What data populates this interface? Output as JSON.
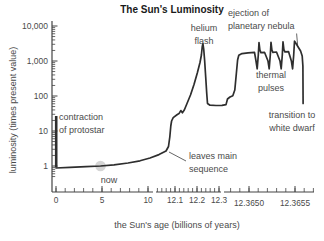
{
  "title": "The Sun's Luminosity",
  "chart_data": {
    "type": "line",
    "title": "The Sun's Luminosity",
    "xlabel": "the Sun's age (billions of years)",
    "ylabel": "luminosity (times present value)",
    "y_scale": "log",
    "y_tick_labels": [
      "1",
      "10",
      "100",
      "1,000",
      "10,000"
    ],
    "x_axis_breaks": "broken x-axis with three segments: 0–10, 12.1–12.3, 12.3650–12.3655 billions of years",
    "x_tick_labels": [
      "0",
      "5",
      "10",
      "12.1",
      "12.2",
      "12.3",
      "12.3650",
      "12.3655"
    ],
    "key_points": [
      {
        "age_byr": 0,
        "luminosity": 25,
        "phase": "contraction of protostar (start of drop)"
      },
      {
        "age_byr": 0,
        "luminosity": 0.9,
        "phase": "settles onto main sequence"
      },
      {
        "age_byr": 4.6,
        "luminosity": 1,
        "phase": "now"
      },
      {
        "age_byr": 10,
        "luminosity": 1.8,
        "phase": "late main sequence"
      },
      {
        "age_byr": 12.1,
        "luminosity": 30,
        "phase": "leaves main sequence / subgiant shelf"
      },
      {
        "age_byr": 12.2,
        "luminosity": 3500,
        "phase": "helium flash at red-giant tip"
      },
      {
        "age_byr": 12.25,
        "luminosity": 50,
        "phase": "helium-burning plateau after flash"
      },
      {
        "age_byr": 12.365,
        "luminosity": 1800,
        "phase": "asymptotic giant branch plateau"
      },
      {
        "age_byr": 12.3652,
        "luminosity": 4000,
        "phase": "thermal pulse peaks (4 pulses, dips to ~600)"
      },
      {
        "age_byr": 12.3655,
        "luminosity": 60,
        "phase": "ejection of planetary nebula, transition to white dwarf (vertical drop)"
      }
    ],
    "annotations": [
      "contraction of protostar",
      "now",
      "leaves main sequence",
      "helium flash",
      "ejection of planetary nebula",
      "thermal pulses",
      "transition to white dwarf"
    ]
  },
  "axes": {
    "y": {
      "label": "luminosity (times present value)",
      "spine_x": 52,
      "spine_top": 21,
      "baseline_y": 192,
      "decade_px": 35,
      "y_of_1": 166,
      "ticks": [
        {
          "label": "1",
          "y": 166
        },
        {
          "label": "10",
          "y": 131
        },
        {
          "label": "100",
          "y": 96
        },
        {
          "label": "1,000",
          "y": 61
        },
        {
          "label": "10,000",
          "y": 26
        }
      ]
    },
    "x": {
      "label": "the Sun's age (billions of years)",
      "baseline_y": 192,
      "segments": [
        {
          "line": [
            52,
            153
          ],
          "label_baseline": 203,
          "majors": [
            {
              "label": "0",
              "x": 56
            },
            {
              "label": "5",
              "x": 102
            },
            {
              "label": "10",
              "x": 148
            }
          ],
          "minors": [
            56,
            65.2,
            74.4,
            83.6,
            92.8,
            102,
            111.2,
            120.4,
            129.6,
            138.8,
            148
          ]
        },
        {
          "line": [
            156,
            221
          ],
          "label_baseline": 203,
          "majors": [
            {
              "label": "12.1",
              "x": 175
            },
            {
              "label": "12.2",
              "x": 197
            },
            {
              "label": "12.3",
              "x": 219
            }
          ],
          "minors": [
            157.4,
            161.8,
            166.2,
            170.6,
            175,
            179.4,
            183.8,
            188.2,
            192.6,
            197,
            201.4,
            205.8,
            210.2,
            214.6,
            219
          ]
        },
        {
          "line": [
            224,
            314
          ],
          "label_baseline": 205.5,
          "majors": [
            {
              "label": "12.3650",
              "x": 249
            },
            {
              "label": "12.3655",
              "x": 295
            }
          ],
          "minors": [
            230.6,
            239.8,
            249,
            258.2,
            267.4,
            276.6,
            285.8,
            295,
            304.2,
            313.4
          ]
        }
      ]
    }
  },
  "curve": {
    "color": "#2e2e2e",
    "width": 1.7,
    "contraction_segment": [
      [
        56.2,
        116
      ],
      [
        56.2,
        167.5
      ]
    ],
    "main_path": [
      [
        56,
        168
      ],
      [
        70,
        167.3
      ],
      [
        86,
        166.7
      ],
      [
        100.5,
        166
      ],
      [
        114,
        164.8
      ],
      [
        128,
        163
      ],
      [
        140,
        160.8
      ],
      [
        150,
        158
      ],
      [
        159,
        154.6
      ],
      [
        166,
        151
      ],
      [
        168.5,
        146.5
      ],
      [
        169.8,
        137
      ],
      [
        170.8,
        126
      ],
      [
        171.6,
        121
      ],
      [
        173.2,
        117.6
      ],
      [
        177,
        114.8
      ],
      [
        179,
        113.6
      ],
      [
        180.8,
        110.6
      ],
      [
        182.4,
        112.8
      ],
      [
        184.3,
        110
      ],
      [
        187,
        103.5
      ],
      [
        190.5,
        95
      ],
      [
        194,
        84.5
      ],
      [
        197.3,
        73
      ],
      [
        200,
        62.5
      ],
      [
        201.4,
        55
      ],
      [
        202.2,
        47
      ],
      [
        202.9,
        43.5
      ],
      [
        203.7,
        49
      ],
      [
        204.6,
        60
      ],
      [
        205.7,
        77
      ],
      [
        206.7,
        93
      ],
      [
        207.5,
        103.5
      ],
      [
        210,
        105.2
      ],
      [
        216,
        105.5
      ],
      [
        222,
        105.4
      ],
      [
        226,
        104.6
      ],
      [
        227.5,
        99
      ],
      [
        230,
        97
      ],
      [
        232.8,
        95.8
      ],
      [
        234.8,
        90
      ],
      [
        236.3,
        74
      ],
      [
        237.6,
        60
      ],
      [
        238.8,
        55.3
      ],
      [
        242,
        53.6
      ],
      [
        248,
        52.8
      ],
      [
        254.5,
        52.3
      ],
      [
        256,
        61
      ],
      [
        257.2,
        68.8
      ],
      [
        258.3,
        55
      ],
      [
        259,
        42.6
      ],
      [
        259.9,
        50
      ],
      [
        260.9,
        52.6
      ],
      [
        264.5,
        52.3
      ],
      [
        268,
        61
      ],
      [
        269.2,
        68.8
      ],
      [
        270.3,
        55
      ],
      [
        271,
        42.3
      ],
      [
        271.9,
        50
      ],
      [
        272.9,
        52.3
      ],
      [
        276.5,
        52
      ],
      [
        280,
        61
      ],
      [
        281.2,
        68.8
      ],
      [
        282.3,
        55
      ],
      [
        283,
        41.9
      ],
      [
        283.9,
        49.6
      ],
      [
        284.9,
        51.9
      ],
      [
        288.5,
        51.6
      ],
      [
        291.4,
        61
      ],
      [
        292.6,
        68.8
      ],
      [
        293.7,
        55
      ],
      [
        294.5,
        41.2
      ],
      [
        295.5,
        42.6
      ],
      [
        296.8,
        44.8
      ],
      [
        298.6,
        47.8
      ],
      [
        300.6,
        51
      ],
      [
        302.2,
        56
      ],
      [
        302.9,
        66
      ],
      [
        303.1,
        103.5
      ]
    ],
    "pointer_lines": [
      {
        "name": "leaves-main-sequence-pointer",
        "from": [
          169,
          152
        ],
        "to": [
          186,
          161
        ]
      },
      {
        "name": "ejection-pointer",
        "from": [
          296.6,
          33.5
        ],
        "to": [
          297.6,
          45
        ]
      }
    ],
    "now_dot": {
      "cx": 100.5,
      "cy": 166,
      "r": 5.3,
      "fill": "#d5d5d5"
    }
  },
  "annotations": {
    "contraction": {
      "lines": [
        "contraction",
        "of protostar"
      ]
    },
    "now": {
      "lines": [
        "now"
      ]
    },
    "leaves": {
      "lines": [
        "leaves main",
        "sequence"
      ]
    },
    "helium": {
      "lines": [
        "helium",
        "flash"
      ]
    },
    "ejection": {
      "lines": [
        "ejection of",
        "planetary nebula"
      ]
    },
    "thermal": {
      "lines": [
        "thermal",
        "pulses"
      ]
    },
    "transition": {
      "lines": [
        "transition to",
        "white dwarf"
      ]
    }
  },
  "colors": {
    "background": "#ffffff",
    "text": "#4a4a4a",
    "title": "#1a1a1a",
    "curve": "#2e2e2e",
    "axis": "#444444",
    "now_dot": "#d5d5d5"
  }
}
